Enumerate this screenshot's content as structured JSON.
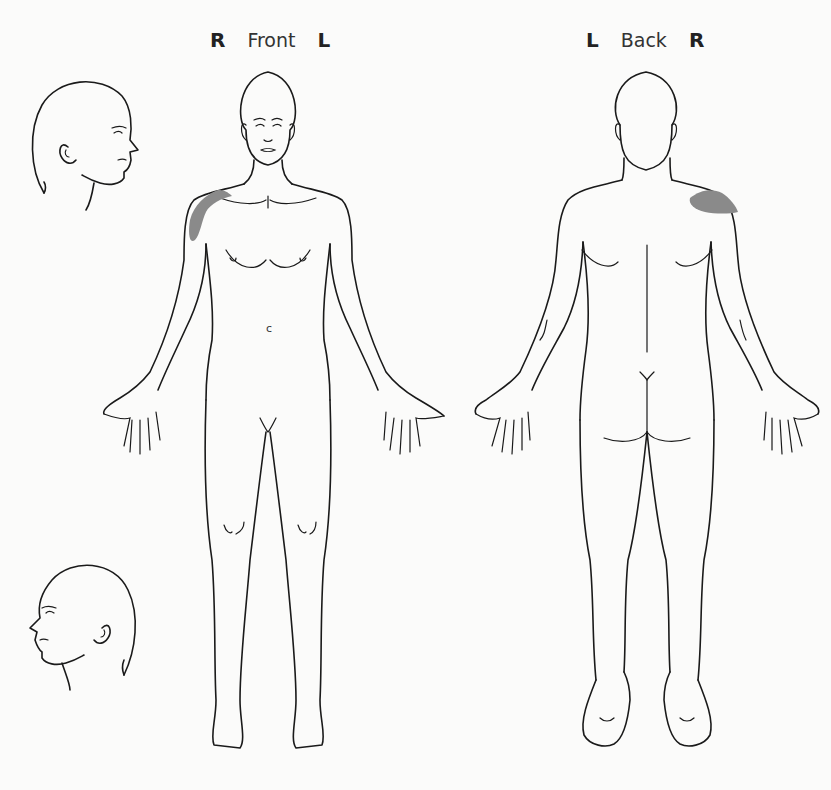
{
  "diagram": {
    "type": "body-pain-chart",
    "front_view": {
      "left_side_label": "R",
      "title": "Front",
      "right_side_label": "L"
    },
    "back_view": {
      "left_side_label": "L",
      "title": "Back",
      "right_side_label": "R"
    },
    "head_profiles": [
      {
        "position": "top-left",
        "facing": "right",
        "side": "right side of head"
      },
      {
        "position": "bottom-left",
        "facing": "left",
        "side": "left side of head"
      }
    ],
    "annotations": {
      "abdomen_mark": "c"
    },
    "shaded_regions": [
      {
        "view": "front",
        "region": "right anterior shoulder / deltoid",
        "color": "#8a8a8a"
      },
      {
        "view": "back",
        "region": "right posterior shoulder / upper trapezius",
        "color": "#8a8a8a"
      }
    ],
    "colors": {
      "background": "#fbfbfa",
      "outline": "#1a1a1a",
      "shading": "#8a8a8a"
    }
  }
}
